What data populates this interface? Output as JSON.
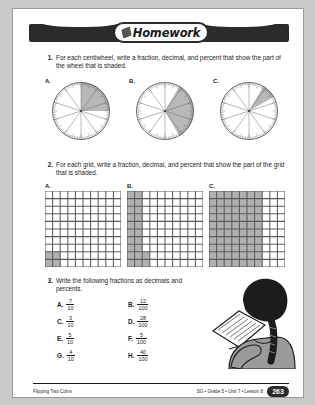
{
  "header": {
    "title": "Homework",
    "pencil_icon": "pencil-icon"
  },
  "questions": [
    {
      "number": "1.",
      "text": "For each centiwheel, write a fraction, decimal, and percent that show the part of the wheel that is shaded."
    },
    {
      "number": "2.",
      "text": "For each grid, write a fraction, decimal, and percent that show the part of the grid that is shaded."
    },
    {
      "number": "3.",
      "text": "Write the following fractions as decimals and percents."
    }
  ],
  "centiwheels": {
    "labels": [
      "A.",
      "B.",
      "C."
    ],
    "items": [
      {
        "label": "A.",
        "shaded_start_deg": 0,
        "shaded_end_deg": 90,
        "sectors": 10,
        "tick_count": 100
      },
      {
        "label": "B.",
        "shaded_start_deg": 330,
        "shaded_end_deg": 150,
        "sectors": 10,
        "tick_count": 100
      },
      {
        "label": "C.",
        "shaded_start_deg": 30,
        "shaded_end_deg": 60,
        "sectors": 10,
        "tick_count": 100
      }
    ]
  },
  "grids": {
    "labels": [
      "A.",
      "B.",
      "C."
    ],
    "items": [
      {
        "label": "A.",
        "rows": 10,
        "cols": 10,
        "shaded_cells": 4,
        "shaded_description": "bottom-left 2x2 block"
      },
      {
        "label": "B.",
        "rows": 10,
        "cols": 10,
        "shaded_cells": 22,
        "shaded_description": "left two columns plus partial third"
      },
      {
        "label": "C.",
        "rows": 10,
        "cols": 10,
        "shaded_cells": 70,
        "shaded_description": "left seven columns"
      }
    ]
  },
  "fractions": {
    "rows": [
      [
        {
          "label": "A.",
          "numerator": "7",
          "denominator": "10"
        },
        {
          "label": "B.",
          "numerator": "12",
          "denominator": "100"
        }
      ],
      [
        {
          "label": "C.",
          "numerator": "3",
          "denominator": "10"
        },
        {
          "label": "D.",
          "numerator": "28",
          "denominator": "100"
        }
      ],
      [
        {
          "label": "E.",
          "numerator": "5",
          "denominator": "10"
        },
        {
          "label": "F.",
          "numerator": "5",
          "denominator": "100"
        }
      ],
      [
        {
          "label": "G.",
          "numerator": "4",
          "denominator": "10"
        },
        {
          "label": "H.",
          "numerator": "40",
          "denominator": "100"
        }
      ]
    ]
  },
  "illustration": {
    "name": "student-writing-illustration",
    "description": "Student seen from behind with braided hair writing on a notepad"
  },
  "footer": {
    "left_text": "Flipping Two Coins",
    "meta_text": "SG • Grade 5 • Unit 7 • Lesson 8",
    "page_number": "263"
  }
}
